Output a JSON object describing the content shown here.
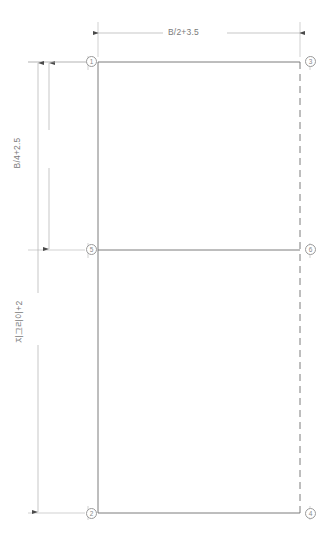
{
  "drawing": {
    "title": "",
    "type": "technical-dimension-drawing",
    "colors": {
      "outline": "#6e6e6e",
      "dimension_line": "#b9b9b9",
      "text": "#7a7a7a",
      "background": "#ffffff"
    },
    "dimensions": [
      {
        "id": "width-dimension",
        "label": "B/2+3.5",
        "orientation": "horizontal",
        "position": "top"
      },
      {
        "id": "upper-height-dimension",
        "label": "B/4+2.5",
        "orientation": "vertical",
        "position": "left-inner"
      },
      {
        "id": "total-height-dimension",
        "label": "지그리이+2",
        "orientation": "vertical",
        "position": "left-outer"
      }
    ],
    "vertices": [
      {
        "id": "vertex-1",
        "label": "1",
        "x": 92,
        "y": 62
      },
      {
        "id": "vertex-3",
        "label": "3",
        "x": 302,
        "y": 62
      },
      {
        "id": "vertex-5",
        "label": "5",
        "x": 92,
        "y": 250
      },
      {
        "id": "vertex-6",
        "label": "6",
        "x": 302,
        "y": 250
      },
      {
        "id": "vertex-2",
        "label": "2",
        "x": 92,
        "y": 513
      },
      {
        "id": "vertex-4",
        "label": "4",
        "x": 302,
        "y": 513
      }
    ],
    "edges": [
      {
        "id": "edge-top",
        "style": "solid"
      },
      {
        "id": "edge-left",
        "style": "solid"
      },
      {
        "id": "edge-bottom",
        "style": "solid"
      },
      {
        "id": "edge-right",
        "style": "dashed"
      },
      {
        "id": "edge-middle-divider",
        "style": "solid"
      }
    ]
  }
}
